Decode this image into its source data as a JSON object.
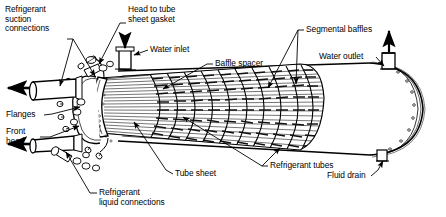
{
  "figure": {
    "style": "black-and-white line drawing"
  },
  "labels": {
    "refrigerant_suction": "Refrigerant\nsuction\nconnections",
    "head_to_tube_sheet_gasket": "Head to tube\nsheet gasket",
    "water_inlet": "Water inlet",
    "baffle_spacer": "Baffle spacer",
    "segmental_baffles": "Segmental baffles",
    "water_outlet": "Water outlet",
    "flanges": "Flanges",
    "front_head": "Front\nhead",
    "tube_sheet": "Tube sheet",
    "refrigerant_tubes": "Refrigerant tubes",
    "refrigerant_liquid": "Refrigerant\nliquid connections",
    "fluid_drain": "Fluid drain"
  },
  "colors": {
    "ink": "#000000",
    "paper": "#ffffff",
    "hatch": "#1a1a1a"
  }
}
